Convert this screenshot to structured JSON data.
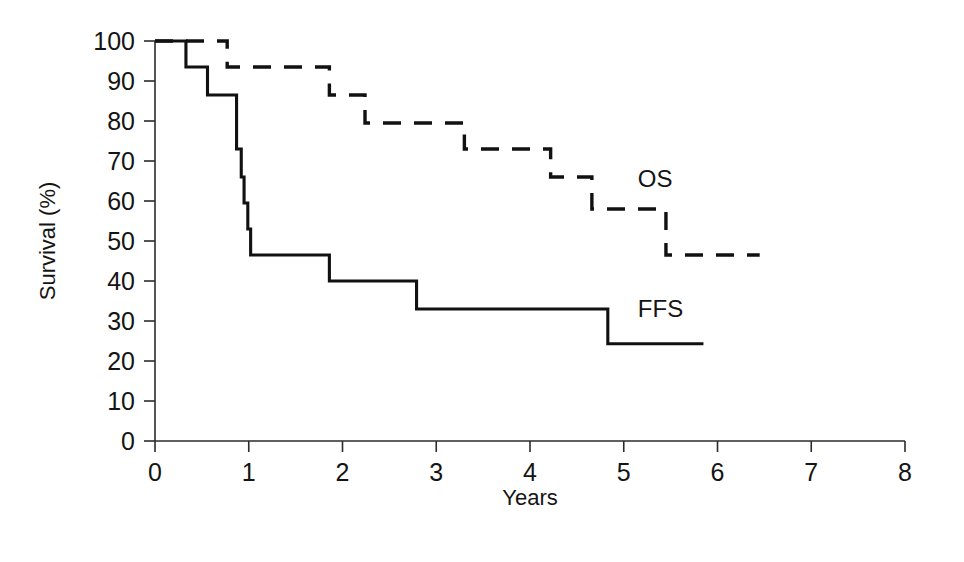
{
  "chart_data": {
    "type": "line",
    "title": "",
    "xlabel": "Years",
    "ylabel": "Survival (%)",
    "xlim": [
      0,
      8
    ],
    "ylim": [
      0,
      100
    ],
    "xticks": [
      0,
      1,
      2,
      3,
      4,
      5,
      6,
      7,
      8
    ],
    "xtick_labels": [
      "0",
      "1",
      "2",
      "3",
      "4",
      "5",
      "6",
      "7",
      "8"
    ],
    "yticks": [
      0,
      10,
      20,
      30,
      40,
      50,
      60,
      70,
      80,
      90,
      100
    ],
    "ytick_labels": [
      "0",
      "10",
      "20",
      "30",
      "40",
      "50",
      "60",
      "70",
      "80",
      "90",
      "100"
    ],
    "grid": false,
    "legend_position": "inline-annotation",
    "series": [
      {
        "name": "OS",
        "label": "OS",
        "style": "dashed",
        "color": "#111111",
        "annotation_x": 5.15,
        "annotation_y": 65.0,
        "steps": [
          [
            0.0,
            100.0
          ],
          [
            0.77,
            100.0
          ],
          [
            0.77,
            93.5
          ],
          [
            1.86,
            93.5
          ],
          [
            1.86,
            86.5
          ],
          [
            2.24,
            86.5
          ],
          [
            2.24,
            79.5
          ],
          [
            3.3,
            79.5
          ],
          [
            3.3,
            73.0
          ],
          [
            4.22,
            73.0
          ],
          [
            4.22,
            66.0
          ],
          [
            4.66,
            66.0
          ],
          [
            4.66,
            58.0
          ],
          [
            5.45,
            58.0
          ],
          [
            5.45,
            46.5
          ],
          [
            6.45,
            46.5
          ]
        ]
      },
      {
        "name": "FFS",
        "label": "FFS",
        "style": "solid",
        "color": "#111111",
        "annotation_x": 5.15,
        "annotation_y": 32.5,
        "steps": [
          [
            0.0,
            100.0
          ],
          [
            0.33,
            100.0
          ],
          [
            0.33,
            93.5
          ],
          [
            0.56,
            93.5
          ],
          [
            0.56,
            86.5
          ],
          [
            0.87,
            86.5
          ],
          [
            0.87,
            73.0
          ],
          [
            0.92,
            73.0
          ],
          [
            0.92,
            66.0
          ],
          [
            0.95,
            66.0
          ],
          [
            0.95,
            59.5
          ],
          [
            0.99,
            59.5
          ],
          [
            0.99,
            53.0
          ],
          [
            1.02,
            53.0
          ],
          [
            1.02,
            46.5
          ],
          [
            1.86,
            46.5
          ],
          [
            1.86,
            40.0
          ],
          [
            2.79,
            40.0
          ],
          [
            2.79,
            33.0
          ],
          [
            4.83,
            33.0
          ],
          [
            4.83,
            24.3
          ],
          [
            5.85,
            24.3
          ]
        ]
      }
    ]
  },
  "axes": {
    "y_axis_title": "Survival (%)",
    "x_axis_title": "Years"
  }
}
